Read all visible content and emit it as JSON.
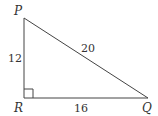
{
  "diagram": {
    "type": "right-triangle",
    "vertices": [
      {
        "name": "P",
        "x": 24,
        "y": 18
      },
      {
        "name": "R",
        "x": 24,
        "y": 98
      },
      {
        "name": "Q",
        "x": 148,
        "y": 98
      }
    ],
    "labels": {
      "P": "P",
      "Q": "Q",
      "R": "R"
    },
    "sides": {
      "PR": "12",
      "RQ": "16",
      "PQ": "20"
    },
    "right_angle_at": "R",
    "colors": {
      "stroke": "#444444",
      "text": "#333333"
    }
  }
}
